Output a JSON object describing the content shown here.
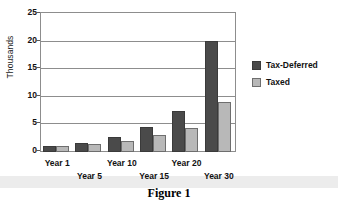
{
  "figure": {
    "caption": "Figure 1"
  },
  "chart_data": {
    "type": "bar",
    "title": "",
    "xlabel": "",
    "ylabel": "Thousands",
    "ylim": [
      0,
      25
    ],
    "yticks": [
      0,
      5,
      10,
      15,
      20,
      25
    ],
    "grid": true,
    "legend_position": "right",
    "categories": [
      "Year 1",
      "Year 5",
      "Year 10",
      "Year 15",
      "Year 20",
      "Year 30"
    ],
    "series": [
      {
        "name": "Tax-Deferred",
        "color": "#4a4a4a",
        "values": [
          1.0,
          1.6,
          2.7,
          4.6,
          7.4,
          20.2
        ]
      },
      {
        "name": "Taxed",
        "color": "#b8b8b8",
        "values": [
          1.0,
          1.4,
          2.0,
          3.0,
          4.4,
          9.0
        ]
      }
    ]
  }
}
